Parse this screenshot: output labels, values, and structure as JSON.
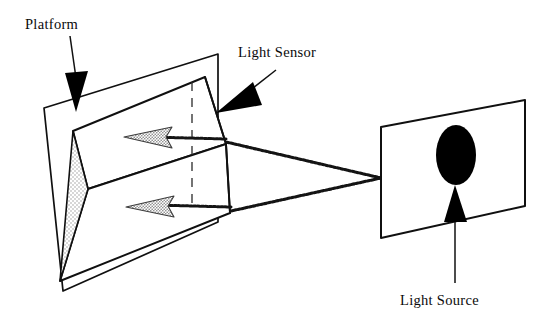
{
  "figure": {
    "background_color": "#ffffff",
    "ink_color": "#101010",
    "stipple_color": "#b9b9b9",
    "ray_color": "#141414",
    "arrowhead_fill": "#000000",
    "gray_arrow_fill": "#8e8e8e",
    "width": 558,
    "height": 334
  },
  "labels": {
    "platform": "Platform",
    "light_sensor": "Light Sensor",
    "light_source": "Light Source"
  },
  "components": {
    "platform_panel": {
      "name": "Platform",
      "shape": "parallelogram",
      "description": "Large tilted plate on the left side"
    },
    "sensor_wedge": {
      "name": "Light Sensor",
      "shape": "wedge",
      "description": "Triangular wedge protruding from the platform, apex pointing right",
      "shaded_face": "stippled triangular side face"
    },
    "light_source_panel": {
      "name": "Light Source",
      "shape": "parallelogram",
      "description": "Panel on the right side containing a filled ellipse emitter"
    },
    "emitter": {
      "name": "light-emitter",
      "shape": "ellipse",
      "fill": "#000000"
    },
    "rays": {
      "count": 2,
      "description": "Two light rays travelling from the source to the sensor wedge",
      "style": "dotted-thick"
    },
    "direction_arrows": {
      "count": 2,
      "description": "Two gray arrows inside the platform showing incoming light direction",
      "points_to": "left"
    },
    "reference_line": {
      "style": "dashed",
      "orientation": "vertical"
    }
  },
  "callouts": [
    {
      "id": "platform-callout",
      "label": "Platform",
      "points_to": "platform top edge"
    },
    {
      "id": "light-sensor-callout",
      "label": "Light Sensor",
      "points_to": "sensor wedge right face"
    },
    {
      "id": "light-source-callout",
      "label": "Light Source",
      "points_to": "light source panel emitter"
    }
  ]
}
